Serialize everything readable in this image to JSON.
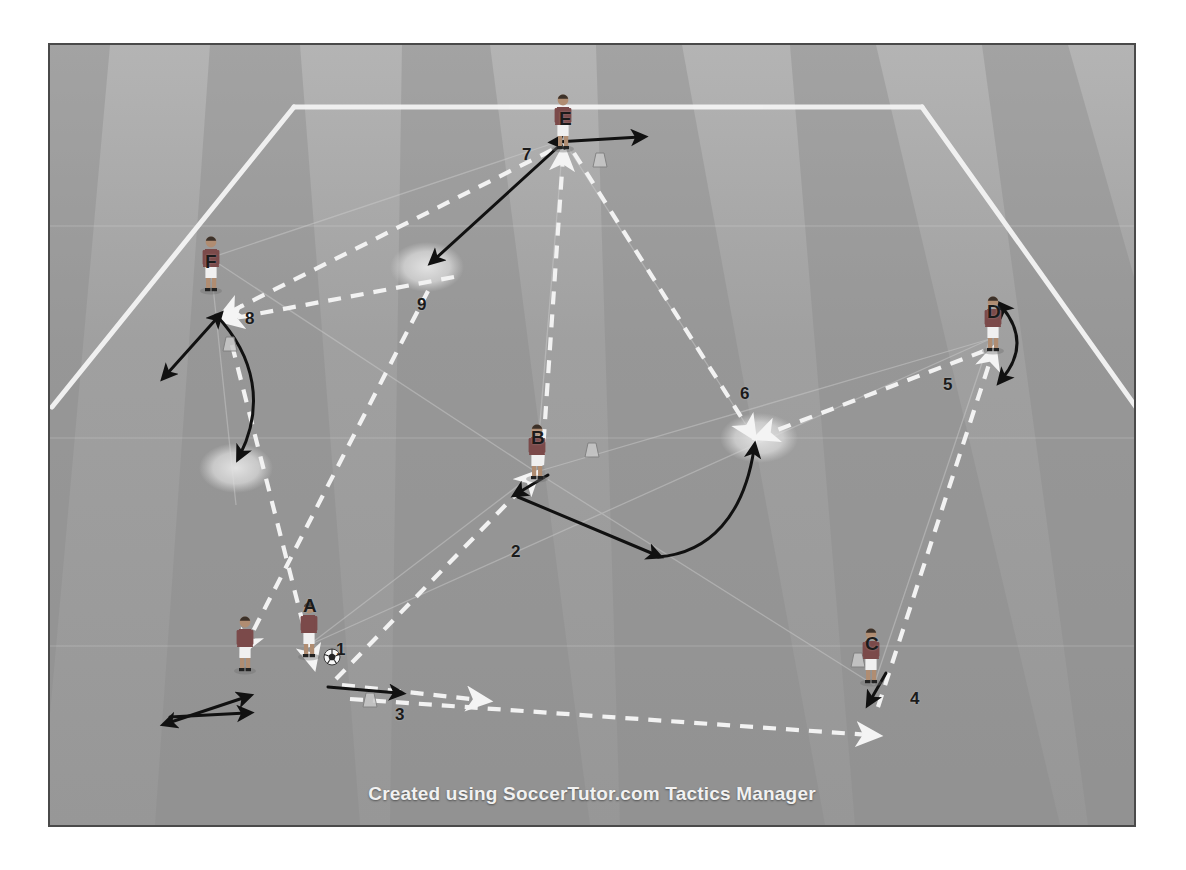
{
  "credit": "Created using SoccerTutor.com Tactics Manager",
  "colors": {
    "grass_light": "#a2a2a2",
    "grass_dark": "#8e8e8e",
    "line_white": "#f4f4f4",
    "pass_arrow": "#f2f2f2",
    "run_arrow": "#111111",
    "marker_zone": "#d9d9d9",
    "shirt": "#7b4a4a",
    "shorts": "#f0f0f0",
    "skin": "#b08d72",
    "frame_border": "#4a4a4a",
    "page_background": "#ffffff",
    "label_text": "#1b1b1b",
    "credit_text": "#f1f1f1"
  },
  "pitch": {
    "frame": {
      "x": 48,
      "y": 43,
      "width": 1088,
      "height": 784
    },
    "boundary_note": "perspective trapezoid, top touchline plus two side lines",
    "stripes": 9
  },
  "players": [
    {
      "id": "A",
      "label": "A",
      "x": 307,
      "y": 636,
      "has_ball": true,
      "note": "ball carrier bottom-left"
    },
    {
      "id": "B",
      "label": "B",
      "x": 534,
      "y": 470,
      "has_ball": false,
      "note": "centre"
    },
    {
      "id": "C",
      "label": "C",
      "x": 872,
      "y": 670,
      "has_ball": false,
      "note": "bottom-right"
    },
    {
      "id": "D",
      "label": "D",
      "x": 988,
      "y": 337,
      "has_ball": false,
      "note": "right"
    },
    {
      "id": "E",
      "label": "E",
      "x": 561,
      "y": 110,
      "has_ball": false,
      "note": "top"
    },
    {
      "id": "F",
      "label": "F",
      "x": 207,
      "y": 252,
      "has_ball": false,
      "note": "left"
    },
    {
      "id": "G",
      "label": "",
      "x": 241,
      "y": 650,
      "has_ball": false,
      "note": "unlabelled support player bottom-left"
    }
  ],
  "sequence_labels": [
    {
      "number": "1",
      "x": 337,
      "y": 645,
      "meaning": "player A starting position with ball"
    },
    {
      "number": "2",
      "x": 511,
      "y": 547,
      "meaning": "pass from A to B"
    },
    {
      "number": "3",
      "x": 395,
      "y": 710,
      "meaning": "pass from A toward C"
    },
    {
      "number": "4",
      "x": 910,
      "y": 694,
      "meaning": "pass reaching C"
    },
    {
      "number": "5",
      "x": 943,
      "y": 380,
      "meaning": "pass from C up to D"
    },
    {
      "number": "6",
      "x": 740,
      "y": 389,
      "meaning": "pass from D into central zone"
    },
    {
      "number": "7",
      "x": 522,
      "y": 150,
      "meaning": "pass up to E"
    },
    {
      "number": "8",
      "x": 245,
      "y": 314,
      "meaning": "pass from E across to F"
    },
    {
      "number": "9",
      "x": 417,
      "y": 300,
      "meaning": "run / ball into left zone"
    }
  ],
  "zone_markers": [
    {
      "id": "zone-9",
      "x": 425,
      "y": 265,
      "rx": 35,
      "ry": 24
    },
    {
      "id": "zone-left",
      "x": 233,
      "y": 466,
      "rx": 35,
      "ry": 24
    },
    {
      "id": "zone-6",
      "x": 757,
      "y": 436,
      "rx": 37,
      "ry": 24
    }
  ],
  "passes": [
    {
      "id": "pass-A-to-B",
      "from": "A",
      "to": "B",
      "style": "dashed-white"
    },
    {
      "id": "pass-A-to-C",
      "from": "A",
      "to": "C",
      "style": "dashed-white"
    },
    {
      "id": "pass-C-to-D",
      "from": "C",
      "to": "D",
      "style": "dashed-white"
    },
    {
      "id": "pass-D-to-6",
      "from": "D",
      "to": "zone-6",
      "style": "dashed-white"
    },
    {
      "id": "pass-E-down",
      "from": "E",
      "to": "B-area",
      "style": "dashed-white"
    },
    {
      "id": "pass-E-to-F",
      "from": "E",
      "to": "F",
      "style": "dashed-white"
    },
    {
      "id": "pass-9-to-F",
      "from": "zone-9",
      "to": "F",
      "style": "dashed-white"
    },
    {
      "id": "pass-F-down",
      "from": "F",
      "to": "bottom-left",
      "style": "dashed-white"
    },
    {
      "id": "pass-B-to-A",
      "from": "B",
      "to": "A",
      "style": "dashed-white"
    }
  ],
  "runs": [
    {
      "id": "run-E-to-zone9",
      "style": "solid-black-arrow",
      "note": "E to zone 9"
    },
    {
      "id": "run-F-curve",
      "style": "solid-black-curve",
      "note": "F curving down to left zone"
    },
    {
      "id": "run-B-to-zone6",
      "style": "solid-black-curve",
      "note": "B moving right into zone 6"
    },
    {
      "id": "run-E-shuttle",
      "style": "double-headed",
      "note": "E lateral shuttle"
    },
    {
      "id": "run-D-shuttle",
      "style": "double-headed",
      "note": "D vertical shuttle"
    },
    {
      "id": "run-F-shuttle",
      "style": "double-headed",
      "note": "F diagonal shuttle"
    },
    {
      "id": "run-G-shuttle",
      "style": "double-headed",
      "note": "support player lateral shuttle"
    }
  ]
}
